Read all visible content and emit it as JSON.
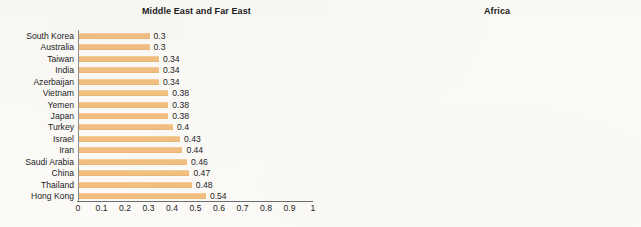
{
  "chart_data": [
    {
      "type": "bar",
      "orientation": "horizontal",
      "title": "Middle East and Far East",
      "xlabel": "",
      "ylabel": "",
      "xlim": [
        0,
        1
      ],
      "grid": false,
      "legend": "none",
      "bar_color": "#f2bf81",
      "xticks": [
        "0",
        "0.1",
        "0.2",
        "0.3",
        "0.4",
        "0.5",
        "0.6",
        "0.7",
        "0.8",
        "0.9",
        "1"
      ],
      "categories": [
        "South Korea",
        "Australia",
        "Taiwan",
        "India",
        "Azerbaijan",
        "Vietnam",
        "Yemen",
        "Japan",
        "Turkey",
        "Israel",
        "Iran",
        "Saudi Arabia",
        "China",
        "Thailand",
        "Hong Kong"
      ],
      "values": [
        0.3,
        0.3,
        0.34,
        0.34,
        0.34,
        0.38,
        0.38,
        0.38,
        0.4,
        0.43,
        0.44,
        0.46,
        0.47,
        0.48,
        0.54
      ],
      "value_labels": [
        "0.3",
        "0.3",
        "0.34",
        "0.34",
        "0.34",
        "0.38",
        "0.38",
        "0.38",
        "0.4",
        "0.43",
        "0.44",
        "0.46",
        "0.47",
        "0.48",
        "0.54"
      ]
    },
    {
      "type": "bar",
      "orientation": "horizontal",
      "title": "Africa",
      "xlabel": "",
      "ylabel": "",
      "xlim": [
        0,
        1
      ],
      "grid": false,
      "legend": "none",
      "bar_color": "#f2bf81",
      "xticks": [
        "0",
        "0.1",
        "0.2",
        "0.3",
        "0.4",
        "0.5",
        "0.6",
        "0.7",
        "0.8",
        "0.9",
        "1"
      ],
      "categories": [
        "Egypt",
        "Ethiopia",
        "Algeria",
        "Tanzania",
        "Uganda",
        "Morocco",
        "Kenya",
        "South Sudan",
        "Rwanda",
        "Zimbabwe",
        "Zambia",
        "Namibia",
        "Botswana",
        "South Africa",
        "Lesotho"
      ],
      "values": [
        0.31,
        0.33,
        0.35,
        0.38,
        0.4,
        0.41,
        0.43,
        0.46,
        0.47,
        0.5,
        0.58,
        0.58,
        0.61,
        0.63,
        0.63
      ],
      "value_labels": [
        "0.31",
        "0.33",
        "0.35",
        "0.38",
        "0.4",
        "0.41",
        "0.43",
        "0.46",
        "0.47",
        "0.5",
        "0.58",
        "0.58",
        "0.61",
        "0.63",
        "0.63"
      ]
    }
  ]
}
